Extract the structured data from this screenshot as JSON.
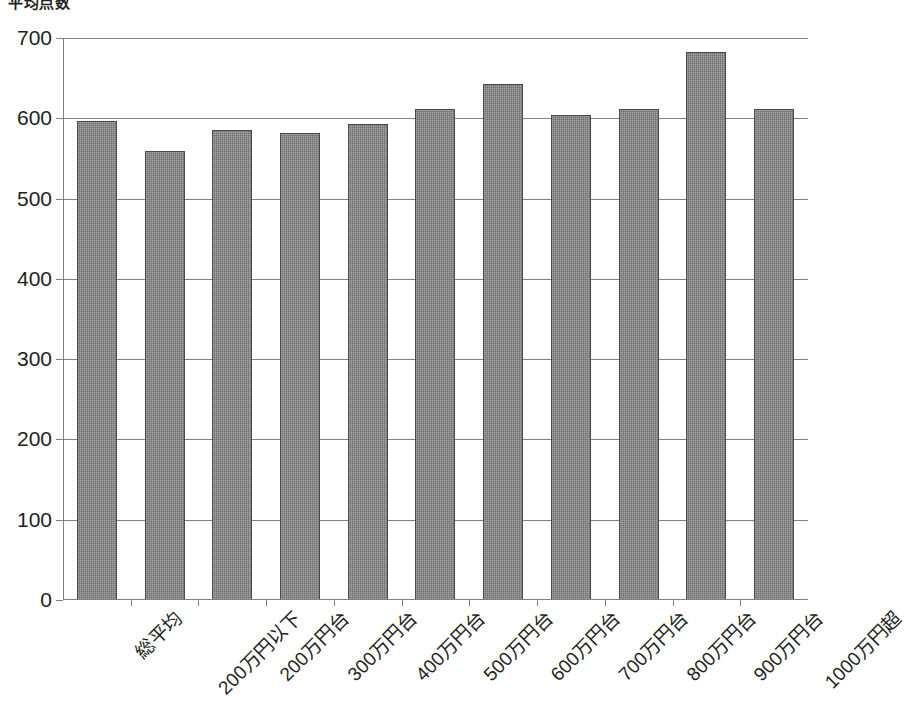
{
  "chart_data": {
    "type": "bar",
    "title": "平均点数",
    "xlabel": "",
    "ylabel": "",
    "ylim": [
      0,
      700
    ],
    "ytick_step": 100,
    "yticks": [
      "700",
      "600",
      "500",
      "400",
      "300",
      "200",
      "100",
      "0"
    ],
    "grid": true,
    "legend": null,
    "bar_color": "#6e6e6e",
    "bar_edge_color": "#4a4a4a",
    "axis_color": "#808080",
    "text_color": "#231f20",
    "categories": [
      "総平均",
      "200万円以下",
      "200万円台",
      "300万円台",
      "400万円台",
      "500万円台",
      "600万円台",
      "700万円台",
      "800万円台",
      "900万円台",
      "1000万円超"
    ],
    "values": [
      597,
      559,
      586,
      582,
      593,
      612,
      643,
      604,
      611,
      682,
      611
    ]
  }
}
